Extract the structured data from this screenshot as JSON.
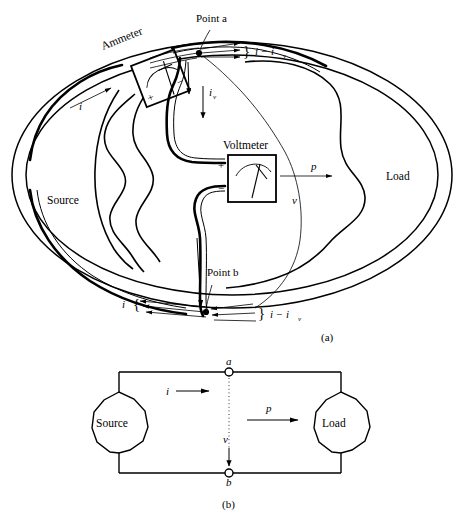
{
  "figure": {
    "panels": [
      {
        "id": "a",
        "caption": "(a)"
      },
      {
        "id": "b",
        "caption": "(b)"
      }
    ]
  },
  "panel_a": {
    "caption": "(a)",
    "source_label": "Source",
    "load_label": "Load",
    "ammeter_label": "Ammeter",
    "voltmeter_label": "Voltmeter",
    "ammeter_plus": "+",
    "ammeter_minus": "−",
    "voltmeter_plus": "+",
    "voltmeter_minus": "−",
    "point_a_label": "Point a",
    "point_b_label": "Point b",
    "current_in_label": "i",
    "current_bottom_label": "i",
    "meter_current_base": "i",
    "meter_current_sub": "v",
    "diff_top_base": "i − i",
    "diff_top_sub": "v",
    "diff_bottom_base": "i − i",
    "diff_bottom_sub": "v",
    "power_label": "p",
    "voltage_label": "v",
    "brace_open": "{",
    "brace_close": "}"
  },
  "panel_b": {
    "caption": "(b)",
    "source_label": "Source",
    "load_label": "Load",
    "node_a_label": "a",
    "node_b_label": "b",
    "current_label": "i",
    "power_label": "p",
    "voltage_label": "v"
  },
  "colors": {
    "ink": "#000000",
    "paper": "#ffffff"
  }
}
